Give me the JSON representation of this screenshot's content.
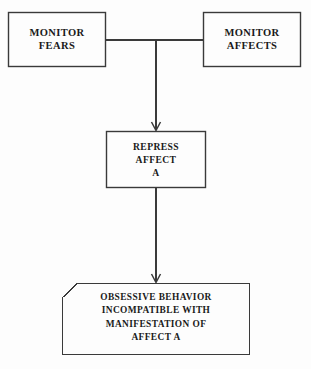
{
  "diagram": {
    "background_color": "#fdfdfd",
    "line_color": "#3a3a3a",
    "text_color": "#1a1a1a",
    "nodes": [
      {
        "id": "monitor-fears",
        "shape": "rectangle",
        "label": "MONITOR\nFEARS",
        "lines": [
          "MONITOR",
          "FEARS"
        ],
        "x": 8,
        "y": 12,
        "width": 98,
        "height": 55
      },
      {
        "id": "monitor-affects",
        "shape": "rectangle",
        "label": "MONITOR\nAFFECTS",
        "lines": [
          "MONITOR",
          "AFFECTS"
        ],
        "x": 203,
        "y": 12,
        "width": 98,
        "height": 55
      },
      {
        "id": "repress-affect-a",
        "shape": "rectangle",
        "label": "REPRESS\nAFFECT\nA",
        "lines": [
          "REPRESS",
          "AFFECT",
          "A"
        ],
        "x": 106,
        "y": 131,
        "width": 100,
        "height": 57
      },
      {
        "id": "obsessive-behavior",
        "shape": "clipped-corner-rectangle",
        "label": "OBSESSIVE BEHAVIOR\nINCOMPATIBLE WITH\nMANIFESTATION OF\nAFFECT A",
        "lines": [
          "OBSESSIVE BEHAVIOR",
          "INCOMPATIBLE WITH",
          "MANIFESTATION OF",
          "AFFECT A"
        ],
        "x": 62,
        "y": 283,
        "width": 188,
        "height": 72,
        "clipped_corner": "top-left"
      }
    ],
    "connectors": [
      {
        "id": "fears-to-junction",
        "from": "monitor-fears",
        "to": "junction",
        "type": "line",
        "arrow": false
      },
      {
        "id": "affects-to-junction",
        "from": "monitor-affects",
        "to": "junction",
        "type": "line",
        "arrow": false
      },
      {
        "id": "junction-to-repress",
        "from": "junction",
        "to": "repress-affect-a",
        "type": "arrow",
        "arrow": true
      },
      {
        "id": "repress-to-obsessive",
        "from": "repress-affect-a",
        "to": "obsessive-behavior",
        "type": "arrow",
        "arrow": true
      }
    ]
  }
}
